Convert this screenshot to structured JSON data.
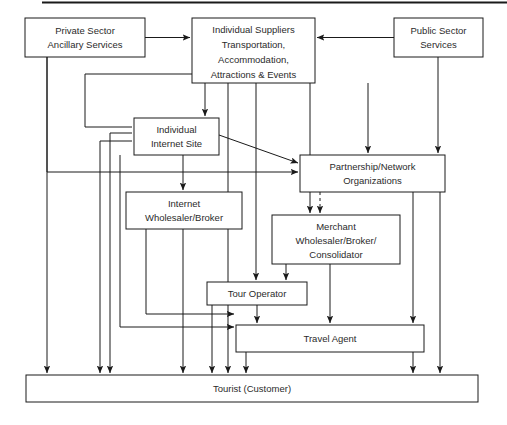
{
  "diagram": {
    "type": "flow-diagram",
    "background_color": "#ffffff",
    "line_color": "#1a1a1a",
    "text_color": "#2b2b2b",
    "header_rule": true,
    "nodes": [
      {
        "id": "private-sector",
        "lines": [
          "Private Sector",
          "Ancillary Services"
        ],
        "x": 25,
        "y": 18,
        "w": 120,
        "h": 39
      },
      {
        "id": "individual-suppliers",
        "lines": [
          "Individual Suppliers",
          "Transportation,",
          "Accommodation,",
          "Attractions & Events"
        ],
        "x": 192,
        "y": 18,
        "w": 123,
        "h": 65
      },
      {
        "id": "public-sector",
        "lines": [
          "Public Sector",
          "Services"
        ],
        "x": 394,
        "y": 18,
        "w": 89,
        "h": 39
      },
      {
        "id": "individual-internet-site",
        "lines": [
          "Individual",
          "Internet Site"
        ],
        "x": 134,
        "y": 118,
        "w": 85,
        "h": 37
      },
      {
        "id": "partnership-network",
        "lines": [
          "Partnership/Network",
          "Organizations"
        ],
        "x": 300,
        "y": 155,
        "w": 145,
        "h": 37
      },
      {
        "id": "internet-wholesaler",
        "lines": [
          "Internet",
          "Wholesaler/Broker"
        ],
        "x": 126,
        "y": 192,
        "w": 116,
        "h": 37
      },
      {
        "id": "merchant-wholesaler",
        "lines": [
          "Merchant",
          "Wholesaler/Broker/",
          "Consolidator"
        ],
        "x": 272,
        "y": 215,
        "w": 128,
        "h": 49
      },
      {
        "id": "tour-operator",
        "lines": [
          "Tour Operator"
        ],
        "x": 207,
        "y": 282,
        "w": 100,
        "h": 23
      },
      {
        "id": "travel-agent",
        "lines": [
          "Travel Agent"
        ],
        "x": 236,
        "y": 325,
        "w": 188,
        "h": 27
      },
      {
        "id": "tourist",
        "lines": [
          "Tourist (Customer)"
        ],
        "x": 26,
        "y": 375,
        "w": 452,
        "h": 27
      }
    ],
    "edges": [
      {
        "id": "private-to-suppliers",
        "from": "private-sector",
        "to": "individual-suppliers",
        "style": "solid"
      },
      {
        "id": "public-to-suppliers",
        "from": "public-sector",
        "to": "individual-suppliers",
        "style": "solid"
      },
      {
        "id": "suppliers-to-internet-site",
        "from": "individual-suppliers",
        "to": "individual-internet-site",
        "style": "solid"
      },
      {
        "id": "suppliers-to-partnership",
        "from": "individual-suppliers",
        "to": "partnership-network",
        "style": "solid"
      },
      {
        "id": "suppliers-to-merchant",
        "from": "individual-suppliers",
        "to": "merchant-wholesaler",
        "style": "solid"
      },
      {
        "id": "suppliers-to-tour-operator",
        "from": "individual-suppliers",
        "to": "tour-operator",
        "style": "solid"
      },
      {
        "id": "suppliers-to-internet-site-left",
        "from": "individual-suppliers",
        "to": "individual-internet-site",
        "style": "solid"
      },
      {
        "id": "public-to-partnership",
        "from": "public-sector",
        "to": "partnership-network",
        "style": "solid"
      },
      {
        "id": "internet-site-to-partnership",
        "from": "individual-internet-site",
        "to": "partnership-network",
        "style": "solid"
      },
      {
        "id": "internet-site-to-wholesaler",
        "from": "individual-internet-site",
        "to": "internet-wholesaler",
        "style": "solid"
      },
      {
        "id": "internet-site-to-tourist",
        "from": "individual-internet-site",
        "to": "tourist",
        "style": "solid"
      },
      {
        "id": "partnership-to-merchant",
        "from": "partnership-network",
        "to": "merchant-wholesaler",
        "style": "dashed"
      },
      {
        "id": "partnership-to-travel-agent",
        "from": "partnership-network",
        "to": "travel-agent",
        "style": "solid"
      },
      {
        "id": "partnership-to-tourist",
        "from": "partnership-network",
        "to": "tourist",
        "style": "solid"
      },
      {
        "id": "merchant-to-tour-operator",
        "from": "merchant-wholesaler",
        "to": "tour-operator",
        "style": "solid"
      },
      {
        "id": "merchant-to-travel-agent",
        "from": "merchant-wholesaler",
        "to": "travel-agent",
        "style": "solid"
      },
      {
        "id": "wholesaler-to-travel-agent",
        "from": "internet-wholesaler",
        "to": "travel-agent",
        "style": "solid"
      },
      {
        "id": "wholesaler-to-tourist",
        "from": "internet-wholesaler",
        "to": "tourist",
        "style": "solid"
      },
      {
        "id": "tour-operator-to-travel-agent",
        "from": "tour-operator",
        "to": "travel-agent",
        "style": "solid"
      },
      {
        "id": "tour-operator-to-tourist",
        "from": "tour-operator",
        "to": "tourist",
        "style": "solid"
      },
      {
        "id": "travel-agent-to-tourist",
        "from": "travel-agent",
        "to": "tourist",
        "style": "solid"
      },
      {
        "id": "private-to-tourist",
        "from": "private-sector",
        "to": "tourist",
        "style": "solid"
      },
      {
        "id": "private-to-partnership",
        "from": "private-sector",
        "to": "partnership-network",
        "style": "solid"
      },
      {
        "id": "suppliers-to-tourist",
        "from": "individual-suppliers",
        "to": "tourist",
        "style": "solid"
      },
      {
        "id": "suppliers-to-travel-agent",
        "from": "individual-suppliers",
        "to": "travel-agent",
        "style": "solid"
      }
    ]
  }
}
